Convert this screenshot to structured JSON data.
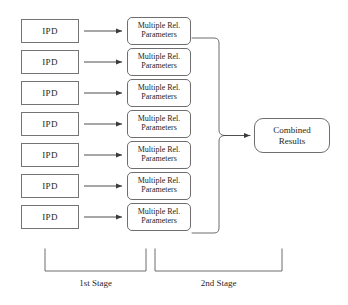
{
  "diagram": {
    "background_color": "#ffffff",
    "line_color": "#6f6d6e",
    "text_color": "#231f20",
    "stage1": {
      "label": "1st Stage",
      "ipd_label": "IPD",
      "params_line1": "Multiple Rel.",
      "params_line2": "Parameters",
      "row_count": 7,
      "rows": [
        {
          "ipd": "IPD",
          "params_line1": "Multiple Rel.",
          "params_line2": "Parameters"
        },
        {
          "ipd": "IPD",
          "params_line1": "Multiple Rel.",
          "params_line2": "Parameters"
        },
        {
          "ipd": "IPD",
          "params_line1": "Multiple Rel.",
          "params_line2": "Parameters"
        },
        {
          "ipd": "IPD",
          "params_line1": "Multiple Rel.",
          "params_line2": "Parameters"
        },
        {
          "ipd": "IPD",
          "params_line1": "Multiple Rel.",
          "params_line2": "Parameters"
        },
        {
          "ipd": "IPD",
          "params_line1": "Multiple Rel.",
          "params_line2": "Parameters"
        },
        {
          "ipd": "IPD",
          "params_line1": "Multiple Rel.",
          "params_line2": "Parameters"
        }
      ]
    },
    "stage2": {
      "label": "2nd Stage",
      "combined_line1": "Combined",
      "combined_line2": "Results"
    },
    "icons": {
      "arrow": "arrow-right-icon",
      "merge": "merge-connector-icon",
      "bracket": "stage-bracket-icon"
    }
  }
}
